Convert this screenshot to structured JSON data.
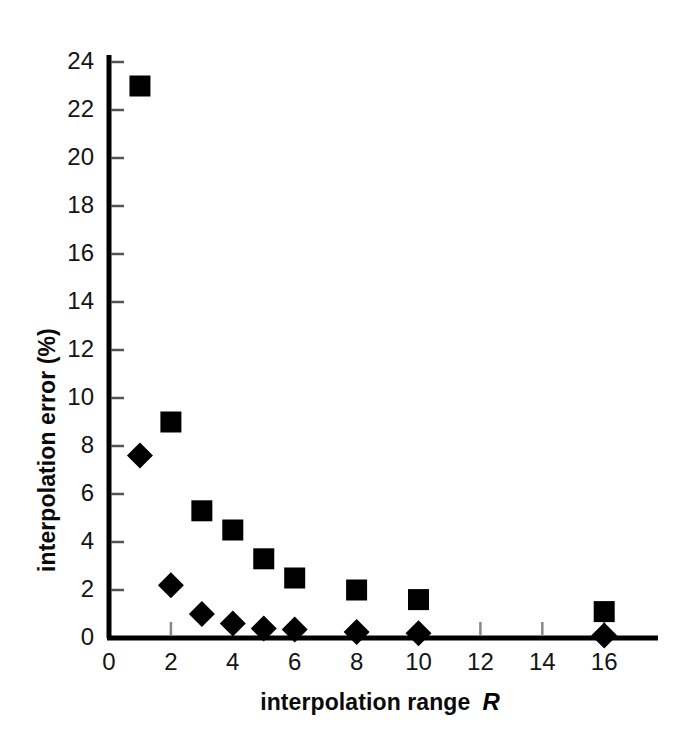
{
  "chart_data": {
    "type": "scatter",
    "title": "",
    "xlabel": "interpolation range",
    "xlabel_variable": "R",
    "ylabel": "interpolation error (%)",
    "xlim": [
      0,
      17.2
    ],
    "ylim": [
      0,
      25
    ],
    "xticks": [
      0,
      2,
      4,
      6,
      8,
      10,
      12,
      14,
      16
    ],
    "yticks": [
      0,
      2,
      4,
      6,
      8,
      10,
      12,
      14,
      16,
      18,
      20,
      22,
      24
    ],
    "xtick_labels": [
      "0",
      "2",
      "4",
      "6",
      "8",
      "10",
      "12",
      "14",
      "16"
    ],
    "ytick_labels": [
      "0",
      "2",
      "4",
      "6",
      "8",
      "10",
      "12",
      "14",
      "16",
      "18",
      "20",
      "22",
      "24"
    ],
    "grid": false,
    "legend": "none",
    "marker_color": "#000000",
    "series": [
      {
        "name": "squares",
        "marker": "square",
        "x": [
          1,
          2,
          3,
          4,
          5,
          6,
          8,
          10,
          16
        ],
        "values": [
          23.0,
          9.0,
          5.3,
          4.5,
          3.3,
          2.5,
          2.0,
          1.6,
          1.1
        ]
      },
      {
        "name": "diamonds",
        "marker": "diamond",
        "x": [
          1,
          2,
          3,
          4,
          5,
          6,
          8,
          10,
          16
        ],
        "values": [
          7.6,
          2.2,
          1.0,
          0.6,
          0.4,
          0.35,
          0.25,
          0.2,
          0.1
        ]
      }
    ]
  },
  "axes": {
    "y_label_text": "interpolation error (%)",
    "x_label_text": "interpolation range",
    "x_label_variable": "R"
  }
}
